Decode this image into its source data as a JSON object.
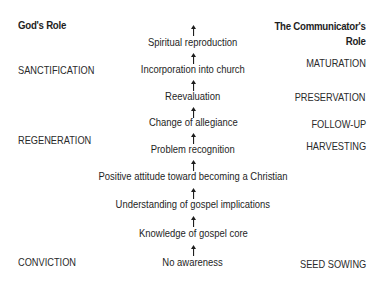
{
  "left_column": {
    "header": "God's Role",
    "labels": [
      {
        "text": "SANCTIFICATION",
        "top": 64
      },
      {
        "text": "REGENERATION",
        "top": 134
      },
      {
        "text": "CONVICTION",
        "top": 256
      }
    ]
  },
  "right_column": {
    "header_line1": "The Communicator's",
    "header_line2": "Role",
    "labels": [
      {
        "text": "MATURATION",
        "top": 57
      },
      {
        "text": "PRESERVATION",
        "top": 91
      },
      {
        "text": "FOLLOW-UP",
        "top": 118
      },
      {
        "text": "HARVESTING",
        "top": 140
      },
      {
        "text": "SEED SOWING",
        "top": 258
      }
    ]
  },
  "steps": [
    {
      "text": "Spiritual reproduction",
      "top": 36
    },
    {
      "text": "Incorporation into church",
      "top": 63
    },
    {
      "text": "Reevaluation",
      "top": 90
    },
    {
      "text": "Change of allegiance",
      "top": 116
    },
    {
      "text": "Problem recognition",
      "top": 143
    },
    {
      "text": "Positive attitude toward becoming a Christian",
      "top": 170
    },
    {
      "text": "Understanding of gospel implications",
      "top": 198
    },
    {
      "text": "Knowledge of gospel core",
      "top": 227
    },
    {
      "text": "No awareness",
      "top": 256
    }
  ],
  "arrows": [
    {
      "top": 22,
      "icon": "arrow-up-icon"
    },
    {
      "top": 50,
      "icon": "arrow-up-icon"
    },
    {
      "top": 77,
      "icon": "arrow-up-icon"
    },
    {
      "top": 104,
      "icon": "arrow-up-icon"
    },
    {
      "top": 130,
      "icon": "arrow-up-icon"
    },
    {
      "top": 157,
      "icon": "arrow-up-icon"
    },
    {
      "top": 185,
      "icon": "arrow-up-icon"
    },
    {
      "top": 213,
      "icon": "arrow-up-icon"
    },
    {
      "top": 242,
      "icon": "arrow-up-icon"
    }
  ],
  "colors": {
    "text": "#222222",
    "background": "#ffffff"
  }
}
